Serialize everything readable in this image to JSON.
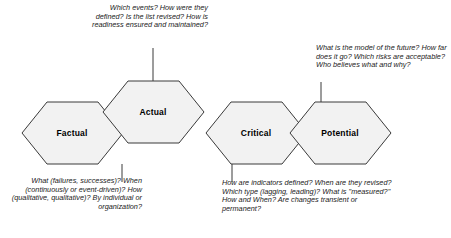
{
  "diagram": {
    "style": {
      "hex_fill": "#f2f2f2",
      "hex_stroke": "#3a3a3a",
      "background": "#ffffff",
      "text_color": "#1a1a1a"
    },
    "hexagons": [
      {
        "id": "factual",
        "label": "Factual"
      },
      {
        "id": "actual",
        "label": "Actual"
      },
      {
        "id": "critical",
        "label": "Critical"
      },
      {
        "id": "potential",
        "label": "Potential"
      }
    ],
    "annotations": [
      {
        "id": "actual-note",
        "attached_to": "actual",
        "position": "top-left",
        "text": "Which events? How were they defined? Is the list revised? How is readiness ensured and maintained?"
      },
      {
        "id": "potential-note",
        "attached_to": "potential",
        "position": "top-right",
        "text": "What is the model of the future? How far does it go? Which risks are acceptable? Who believes what and why?"
      },
      {
        "id": "factual-note",
        "attached_to": "factual",
        "position": "bottom-left",
        "text": "What (failures, successes)? When (continuously or event-driven)? How (qualitative, qualitative)? By individual or organization?"
      },
      {
        "id": "critical-note",
        "attached_to": "critical",
        "position": "bottom-center",
        "text": "How are indicators defined? When are they revised? Which type (lagging, leading)? What is \"measured?\" How and When? Are changes transient or permanent?"
      }
    ]
  }
}
